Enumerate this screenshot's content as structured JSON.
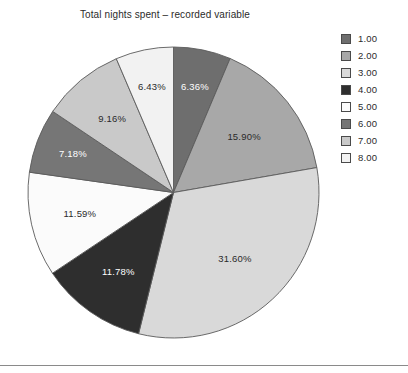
{
  "chart_data": {
    "type": "pie",
    "title": "Total nights spent – recorded variable",
    "legend_position": "right",
    "categories": [
      "1.00",
      "2.00",
      "3.00",
      "4.00",
      "5.00",
      "6.00",
      "7.00",
      "8.00"
    ],
    "values": [
      6.36,
      15.9,
      31.6,
      11.78,
      11.59,
      7.18,
      9.16,
      6.43
    ],
    "value_unit": "percent",
    "data_labels": [
      "6.36%",
      "15.90%",
      "31.60%",
      "11.78%",
      "11.59%",
      "7.18%",
      "9.16%",
      "6.43%"
    ],
    "slice_colors": [
      "#6e6e6e",
      "#a8a8a8",
      "#d9d9d9",
      "#2e2e2e",
      "#fbfbfb",
      "#767676",
      "#c9c9c9",
      "#f2f2f2"
    ],
    "label_text_colors": [
      "#ffffff",
      "#2a2a2a",
      "#2a2a2a",
      "#ffffff",
      "#2a2a2a",
      "#ffffff",
      "#2a2a2a",
      "#2a2a2a"
    ],
    "start_angle_deg": 0,
    "direction": "clockwise",
    "xlabel": "",
    "ylabel": "",
    "grid": false
  },
  "legend": {
    "items": [
      {
        "label": "1.00",
        "color": "#6e6e6e"
      },
      {
        "label": "2.00",
        "color": "#a8a8a8"
      },
      {
        "label": "3.00",
        "color": "#d9d9d9"
      },
      {
        "label": "4.00",
        "color": "#2e2e2e"
      },
      {
        "label": "5.00",
        "color": "#fbfbfb"
      },
      {
        "label": "6.00",
        "color": "#767676"
      },
      {
        "label": "7.00",
        "color": "#c9c9c9"
      },
      {
        "label": "8.00",
        "color": "#f2f2f2"
      }
    ]
  },
  "slice_labels": {
    "s0": "6.36%",
    "s1": "15.90%",
    "s2": "31.60%",
    "s3": "11.78%",
    "s4": "11.59%",
    "s5": "7.18%",
    "s6": "9.16%",
    "s7": "6.43%"
  }
}
